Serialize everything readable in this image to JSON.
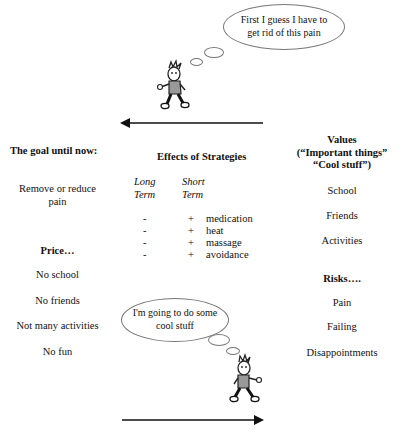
{
  "top_scene": {
    "thought": [
      "First I guess I have to",
      "get rid of this pain"
    ],
    "arrow_direction": "left"
  },
  "bottom_scene": {
    "thought": [
      "I'm going to do some",
      "cool stuff"
    ],
    "arrow_direction": "right"
  },
  "left_column": {
    "goal_heading": "The goal until now:",
    "goal_text": [
      "Remove or reduce",
      "pain"
    ],
    "price_heading": "Price…",
    "price_items": [
      "No school",
      "No friends",
      "Not many activities",
      "No fun"
    ]
  },
  "middle_column": {
    "heading": "Effects of Strategies",
    "col_long": [
      "Long",
      "Term"
    ],
    "col_short": [
      "Short",
      "Term"
    ],
    "rows": [
      {
        "long": "-",
        "short": "+",
        "strategy": "medication"
      },
      {
        "long": "-",
        "short": "+",
        "strategy": "heat"
      },
      {
        "long": "-",
        "short": "+",
        "strategy": "massage"
      },
      {
        "long": "-",
        "short": "+",
        "strategy": "avoidance"
      }
    ]
  },
  "right_column": {
    "values_heading": [
      "Values",
      "(“Important things”",
      "“Cool stuff”)"
    ],
    "values_items": [
      "School",
      "Friends",
      "Activities"
    ],
    "risks_heading": "Risks….",
    "risks_items": [
      "Pain",
      "Failing",
      "Disappointments"
    ]
  }
}
